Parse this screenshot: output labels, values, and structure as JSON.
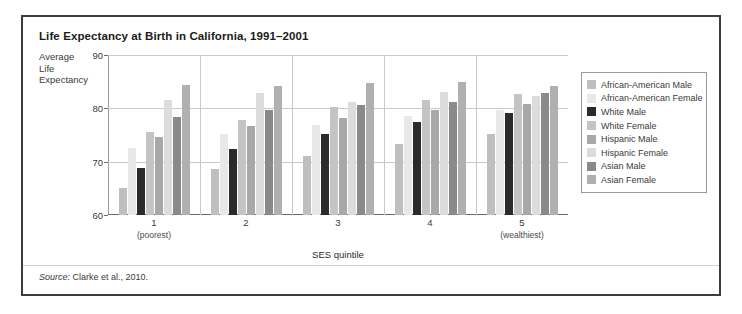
{
  "title": "Life Expectancy at Birth in California, 1991–2001",
  "axis_title_lines": [
    "Average",
    "Life",
    "Expectancy"
  ],
  "source": {
    "prefix": "Source:",
    "text": " Clarke et al., 2010."
  },
  "legend": {
    "items": [
      {
        "label": "African-American Male",
        "color": "#bfbfbf"
      },
      {
        "label": "African-American Female",
        "color": "#e8e8e8"
      },
      {
        "label": "White Male",
        "color": "#2b2b2b"
      },
      {
        "label": "White Female",
        "color": "#c4c4c4"
      },
      {
        "label": "Hispanic Male",
        "color": "#a8a8a8"
      },
      {
        "label": "Hispanic Female",
        "color": "#dcdcdc"
      },
      {
        "label": "Asian Male",
        "color": "#8a8a8a"
      },
      {
        "label": "Asian Female",
        "color": "#b0b0b0"
      }
    ]
  },
  "chart_data": {
    "type": "bar",
    "title": "Life Expectancy at Birth in California, 1991–2001",
    "xlabel": "SES quintile",
    "ylabel": "Average Life Expectancy",
    "ylim": [
      60,
      90
    ],
    "yticks": [
      60,
      70,
      80,
      90
    ],
    "grid": true,
    "legend_position": "right",
    "categories": [
      "1",
      "2",
      "3",
      "4",
      "5"
    ],
    "category_sublabels": [
      "(poorest)",
      "",
      "",
      "",
      "(wealthiest)"
    ],
    "series": [
      {
        "name": "African-American Male",
        "color": "#bfbfbf",
        "values": [
          65.0,
          68.6,
          71.1,
          73.4,
          75.2
        ]
      },
      {
        "name": "African-American Female",
        "color": "#e8e8e8",
        "values": [
          72.6,
          75.1,
          76.8,
          78.5,
          79.7
        ]
      },
      {
        "name": "White Male",
        "color": "#2b2b2b",
        "values": [
          68.9,
          72.4,
          75.2,
          77.4,
          79.2
        ]
      },
      {
        "name": "White Female",
        "color": "#c4c4c4",
        "values": [
          75.6,
          77.9,
          80.3,
          81.6,
          82.7
        ]
      },
      {
        "name": "Hispanic Male",
        "color": "#a8a8a8",
        "values": [
          74.6,
          76.6,
          78.2,
          79.6,
          80.8
        ]
      },
      {
        "name": "Hispanic Female",
        "color": "#dcdcdc",
        "values": [
          81.6,
          82.9,
          81.2,
          83.1,
          82.3
        ]
      },
      {
        "name": "Asian Male",
        "color": "#8a8a8a",
        "values": [
          78.4,
          79.7,
          80.6,
          81.2,
          82.8
        ]
      },
      {
        "name": "Asian Female",
        "color": "#b0b0b0",
        "values": [
          84.4,
          84.1,
          84.8,
          84.9,
          84.2
        ]
      }
    ]
  }
}
